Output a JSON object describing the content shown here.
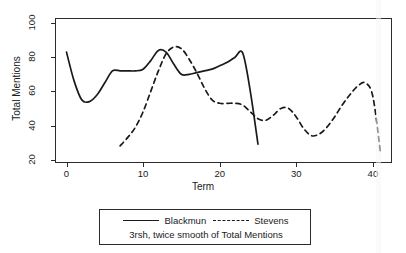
{
  "chart_data": {
    "type": "line",
    "title": "",
    "subtitle": "",
    "xlabel": "Term",
    "ylabel": "Total Mentions",
    "xlim": [
      -1.5,
      42.5
    ],
    "ylim": [
      18,
      103
    ],
    "xticks": [
      0,
      10,
      20,
      30,
      40
    ],
    "yticks": [
      20,
      40,
      60,
      80,
      100
    ],
    "grid": false,
    "legend_position": "below-plot",
    "annotation": "3rsh, twice smooth of Total Mentions",
    "series": [
      {
        "name": "Blackmun",
        "style": "solid",
        "color": "#1a1a1a",
        "x": [
          0,
          1,
          2,
          3,
          4,
          5,
          6,
          7,
          8,
          9,
          10,
          11,
          12,
          13,
          14,
          15,
          16,
          17,
          18,
          19,
          20,
          21,
          22,
          23,
          24,
          25
        ],
        "y": [
          83,
          66,
          55,
          54,
          58,
          65,
          72,
          72,
          72,
          72,
          73,
          78,
          84,
          83,
          76,
          70,
          70,
          71,
          72,
          73,
          75,
          77,
          80,
          82.5,
          60,
          29
        ]
      },
      {
        "name": "Stevens",
        "style": "dashed",
        "color": "#1a1a1a",
        "x": [
          7,
          8,
          9,
          10,
          11,
          12,
          13,
          14,
          15,
          16,
          17,
          18,
          19,
          20,
          21,
          22,
          23,
          24,
          25,
          26,
          27,
          28,
          29,
          30,
          31,
          32,
          33,
          34,
          35,
          36,
          37,
          38,
          39,
          40,
          41
        ],
        "y": [
          28,
          33,
          39,
          48,
          60,
          72,
          82,
          86,
          85,
          79,
          71,
          62,
          55,
          53,
          53,
          53,
          52,
          48,
          44,
          43,
          46,
          50,
          50,
          45,
          38,
          34,
          35,
          39,
          45,
          52,
          58,
          63,
          65,
          57,
          24
        ]
      }
    ]
  },
  "axes": {
    "x_title": "Term",
    "y_title": "Total Mentions",
    "x_tick_labels": [
      "0",
      "10",
      "20",
      "30",
      "40"
    ],
    "y_tick_labels": [
      "20",
      "40",
      "60",
      "80",
      "100"
    ]
  },
  "legend": {
    "entries": [
      {
        "label": "Blackmun",
        "style": "solid"
      },
      {
        "label": "Stevens",
        "style": "dashed"
      }
    ],
    "caption": "3rsh, twice smooth of Total Mentions"
  },
  "colors": {
    "line": "#1a1a1a",
    "frame": "#2b2b2b",
    "background": "#ffffff"
  }
}
